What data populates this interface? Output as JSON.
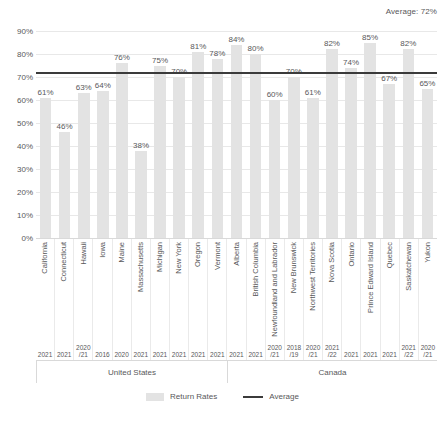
{
  "average_caption": "Average: 72%",
  "legend": {
    "bars_label": "Return Rates",
    "line_label": "Average"
  },
  "groups": [
    {
      "name": "United States",
      "count": 10
    },
    {
      "name": "Canada",
      "count": 11
    }
  ],
  "chart_data": {
    "type": "bar",
    "title": "",
    "subtitle": "",
    "xlabel": "",
    "ylabel": "",
    "ylim": [
      0,
      90
    ],
    "ytick_labels": [
      "0%",
      "10%",
      "20%",
      "30%",
      "40%",
      "50%",
      "60%",
      "70%",
      "80%",
      "90%"
    ],
    "ytick_values": [
      0,
      10,
      20,
      30,
      40,
      50,
      60,
      70,
      80,
      90
    ],
    "grid": true,
    "legend_position": "bottom-center",
    "categories": [
      "California",
      "Connecticut",
      "Hawaii",
      "Iowa",
      "Maine",
      "Massachusetts",
      "Michigan",
      "New York",
      "Oregon",
      "Vermont",
      "Alberta",
      "British Columbia",
      "Newfoundland and Labrador",
      "New Brunswick",
      "Northwest Territories",
      "Nova Scotia",
      "Ontario",
      "Prince Edward Island",
      "Quebec",
      "Saskatchewan",
      "Yukon"
    ],
    "year_labels": [
      "2021",
      "2021",
      "2020\n/21",
      "2016",
      "2020",
      "2021",
      "2021",
      "2021",
      "2021",
      "2021",
      "2021",
      "2021",
      "2020\n/21",
      "2018\n/19",
      "2020\n/21",
      "2021\n/22",
      "2021",
      "2021",
      "2021",
      "2021\n/22",
      "2020\n/21"
    ],
    "values": [
      61,
      46,
      63,
      64,
      76,
      38,
      75,
      70,
      81,
      78,
      84,
      80,
      60,
      70,
      61,
      82,
      74,
      85,
      67,
      82,
      65
    ],
    "data_labels": [
      "61%",
      "46%",
      "63%",
      "64%",
      "76%",
      "38%",
      "75%",
      "70%",
      "81%",
      "78%",
      "84%",
      "80%",
      "60%",
      "70%",
      "61%",
      "82%",
      "74%",
      "85%",
      "67%",
      "82%",
      "65%"
    ],
    "series": [
      {
        "name": "Return Rates",
        "values": [
          61,
          46,
          63,
          64,
          76,
          38,
          75,
          70,
          81,
          78,
          84,
          80,
          60,
          70,
          61,
          82,
          74,
          85,
          67,
          82,
          65
        ],
        "color": "#e3e3e3"
      }
    ],
    "average_line": {
      "name": "Average",
      "value": 72,
      "color": "#3b3b3b"
    },
    "group_labels": [
      "United States",
      "Canada"
    ]
  }
}
